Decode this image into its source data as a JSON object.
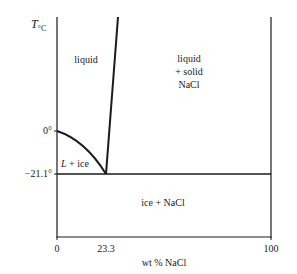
{
  "diagram": {
    "type": "phase-diagram",
    "title": "",
    "y_axis": {
      "label_main": "T",
      "label_sub": "°C"
    },
    "x_axis": {
      "label": "wt % NaCl",
      "range": [
        0,
        100
      ]
    },
    "x_ticks": [
      "0",
      "23.3",
      "100"
    ],
    "y_ticks": [
      "0°",
      "−21.1°"
    ],
    "eutectic": {
      "composition": 23.3,
      "temperature": -21.1
    },
    "regions": {
      "liquid": "liquid",
      "liquid_solid": [
        "liquid",
        "+ solid",
        "NaCl"
      ],
      "l_ice_italic": "L",
      "l_ice_rest": " + ice",
      "ice_nacl": "ice + NaCl"
    },
    "colors": {
      "ink": "#1a1a1a",
      "background": "#ffffff"
    }
  }
}
